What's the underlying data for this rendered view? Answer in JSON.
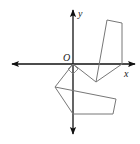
{
  "diagram": {
    "type": "coordinate-plane-geometry",
    "labels": {
      "origin": "O",
      "x_axis": "x",
      "y_axis": "y"
    },
    "colors": {
      "axes": "#111111",
      "shapes": "#777777",
      "background": "#ffffff"
    },
    "axes": {
      "origin_px": [
        73,
        64
      ],
      "x_axis_px": {
        "from": [
          12,
          64
        ],
        "to": [
          135,
          64
        ],
        "arrows": "both"
      },
      "y_axis_px": {
        "from": [
          73,
          10
        ],
        "to": [
          73,
          134
        ],
        "arrows": "both"
      }
    },
    "shapes": [
      {
        "name": "upper-quadrilateral",
        "points_px": [
          [
            107,
            20
          ],
          [
            122,
            23
          ],
          [
            122,
            64
          ],
          [
            96,
            82
          ]
        ]
      },
      {
        "name": "lower-pentagon",
        "points_px": [
          [
            55,
            87
          ],
          [
            116,
            99
          ],
          [
            113,
            114
          ],
          [
            73,
            114
          ]
        ]
      },
      {
        "name": "connector-segments",
        "segments_px": [
          [
            [
              73,
              64
            ],
            [
              55,
              87
            ]
          ],
          [
            [
              73,
              64
            ],
            [
              96,
              82
            ]
          ]
        ]
      },
      {
        "name": "right-angle-marker",
        "points_px": [
          [
            73,
            64
          ],
          [
            68,
            69
          ],
          [
            73,
            74
          ],
          [
            78,
            69
          ]
        ]
      }
    ]
  }
}
